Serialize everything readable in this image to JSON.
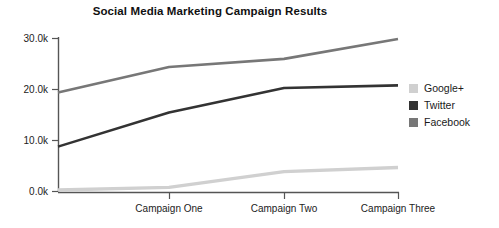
{
  "chart_data": {
    "type": "line",
    "title": "Social Media Marketing Campaign Results",
    "xlabel": "",
    "ylabel": "",
    "categories": [
      "",
      "Campaign One",
      "Campaign Two",
      "Campaign Three"
    ],
    "x_tick_labels": [
      "Campaign One",
      "Campaign Two",
      "Campaign Three"
    ],
    "y_tick_labels": [
      "0.0k",
      "10.0k",
      "20.0k",
      "30.0k"
    ],
    "y_tick_values": [
      0,
      10000,
      20000,
      30000
    ],
    "ylim": [
      0,
      30000
    ],
    "grid": false,
    "legend_position": "right",
    "series": [
      {
        "name": "Google+",
        "color": "#d0d0d0",
        "values": [
          300,
          800,
          3900,
          4700
        ]
      },
      {
        "name": "Twitter",
        "color": "#333333",
        "values": [
          8800,
          15500,
          20300,
          20800
        ]
      },
      {
        "name": "Facebook",
        "color": "#777777",
        "values": [
          19400,
          24400,
          26000,
          29900
        ]
      }
    ]
  },
  "axis": {
    "tick_0": "0.0k",
    "tick_1": "10.0k",
    "tick_2": "20.0k",
    "tick_3": "30.0k",
    "x_tick_0": "Campaign One",
    "x_tick_1": "Campaign Two",
    "x_tick_2": "Campaign Three"
  },
  "legend": {
    "items": [
      {
        "label": "Google+",
        "color": "#d0d0d0"
      },
      {
        "label": "Twitter",
        "color": "#333333"
      },
      {
        "label": "Facebook",
        "color": "#777777"
      }
    ]
  },
  "colors": {
    "google_plus": "#d0d0d0",
    "twitter": "#333333",
    "facebook": "#777777",
    "axis": "#555555",
    "text": "#1a1a1a"
  }
}
